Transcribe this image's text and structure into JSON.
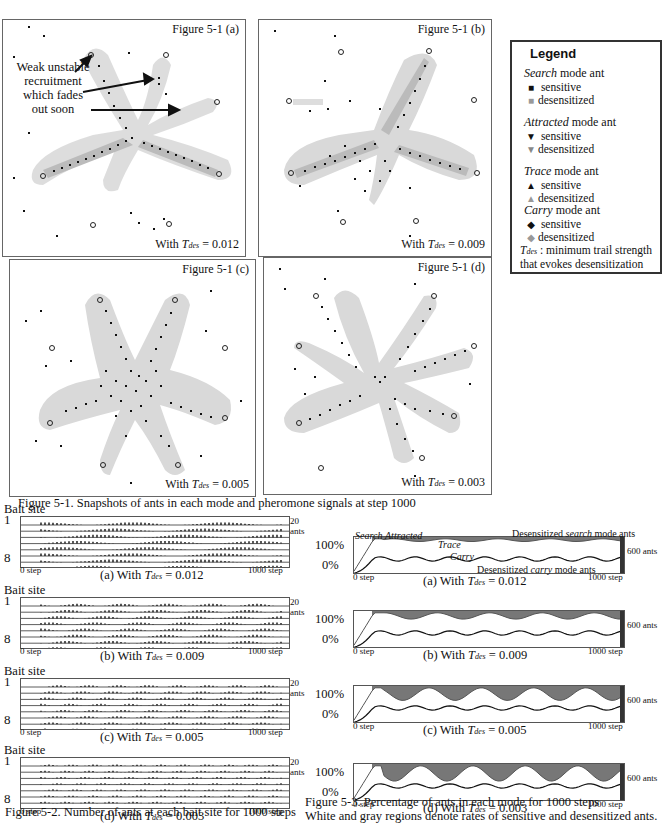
{
  "figure_5_1": {
    "panels": [
      {
        "id": "a",
        "title": "Figure 5-1 (a)",
        "caption_prefix": "With ",
        "tdes_label": "T",
        "tdes_sub": "des",
        "caption_value": " = 0.012"
      },
      {
        "id": "b",
        "title": "Figure 5-1 (b)",
        "caption_prefix": "With ",
        "tdes_label": "T",
        "tdes_sub": "des",
        "caption_value": " = 0.009"
      },
      {
        "id": "c",
        "title": "Figure 5-1 (c)",
        "caption_prefix": "With ",
        "tdes_label": "T",
        "tdes_sub": "des",
        "caption_value": " = 0.005"
      },
      {
        "id": "d",
        "title": "Figure 5-1 (d)",
        "caption_prefix": "With ",
        "tdes_label": "T",
        "tdes_sub": "des",
        "caption_value": " = 0.003"
      }
    ],
    "annotation": "Weak unstable recruitment which fades out soon",
    "annotation_lines": [
      "Weak unstable",
      "recruitment",
      "which fades",
      "out soon"
    ],
    "caption": "Figure 5-1. Snapshots of ants in each mode and pheromone signals at step 1000"
  },
  "legend": {
    "title": "Legend",
    "groups": [
      {
        "mode": "Search",
        "suffix": " mode ant",
        "sensitive": "sensitive",
        "desensitized": "desensitized",
        "symbol": "■"
      },
      {
        "mode": "Attracted",
        "suffix": " mode ant",
        "sensitive": "sensitive",
        "desensitized": "desensitized",
        "symbol": "▼"
      },
      {
        "mode": "Trace",
        "suffix": " mode ant",
        "sensitive": "sensitive",
        "desensitized": "desensitized",
        "symbol": "▲"
      },
      {
        "mode": "Carry",
        "suffix": " mode ant",
        "sensitive": "sensitive",
        "desensitized": "desensitized",
        "symbol": "◆"
      }
    ],
    "note_symbol": "T",
    "note_sub": "des",
    "note_text": " : minimum trail strength that evokes desensitization"
  },
  "figure_5_2": {
    "ylabel_top": "Bait site",
    "site_first": "1",
    "site_last": "8",
    "scale_label": "20 ants",
    "x_start": "0 step",
    "x_end": "1000 step",
    "subplots": [
      {
        "label": "(a) With ",
        "tdes": "T",
        "sub": "des",
        "value": " = 0.012"
      },
      {
        "label": "(b) With ",
        "tdes": "T",
        "sub": "des",
        "value": " = 0.009"
      },
      {
        "label": "(c) With ",
        "tdes": "T",
        "sub": "des",
        "value": " = 0.005"
      },
      {
        "label": "(d) With ",
        "tdes": "T",
        "sub": "des",
        "value": " = 0.003"
      }
    ],
    "caption": "Figure 5-2. Number of ants at each bait site for 1000 steps"
  },
  "figure_5_3": {
    "y_top": "100%",
    "y_bottom": "0%",
    "scale_label": "600 ants",
    "x_start": "0 step",
    "x_end": "1000 step",
    "annotations": {
      "search": "Search",
      "attracted": "Attracted",
      "trace": "Trace",
      "carry": "Carry",
      "desens_search_prefix": "Desensitized ",
      "desens_search_mode": "search",
      "desens_search_suffix": " mode ants",
      "desens_carry_prefix": "Desensitized ",
      "desens_carry_mode": "carry",
      "desens_carry_suffix": " mode ants"
    },
    "subplots": [
      {
        "label": "(a) With ",
        "tdes": "T",
        "sub": "des",
        "value": " = 0.012"
      },
      {
        "label": "(b) With ",
        "tdes": "T",
        "sub": "des",
        "value": " = 0.009"
      },
      {
        "label": "(c) With ",
        "tdes": "T",
        "sub": "des",
        "value": " = 0.005"
      },
      {
        "label": "(d) With ",
        "tdes": "T",
        "sub": "des",
        "value": " = 0.003"
      }
    ],
    "caption_line1": "Figure 5-3. Percentage of ants in each mode  for 1000 steps",
    "caption_line2": "White and gray regions denote rates of sensitive and desensitized ants."
  },
  "chart_data": [
    {
      "type": "scatter",
      "title": "Figure 5-1 (a)",
      "note": "Ant snapshot at step 1000, T_des = 0.012; 3 strong trails + weak unstable recruitment"
    },
    {
      "type": "scatter",
      "title": "Figure 5-1 (b)",
      "note": "Ant snapshot at step 1000, T_des = 0.009; 3 trails"
    },
    {
      "type": "scatter",
      "title": "Figure 5-1 (c)",
      "note": "Ant snapshot at step 1000, T_des = 0.005; 4-5 trails, dispersed ants"
    },
    {
      "type": "scatter",
      "title": "Figure 5-1 (d)",
      "note": "Ant snapshot at step 1000, T_des = 0.003; 6 trails"
    },
    {
      "type": "line",
      "title": "Figure 5-2",
      "xlabel": "step",
      "x_range": [
        0,
        1000
      ],
      "ylabel": "Bait site",
      "series_count": 8,
      "scale": "20 ants",
      "subplots": [
        "T_des = 0.012",
        "T_des = 0.009",
        "T_des = 0.005",
        "T_des = 0.003"
      ]
    },
    {
      "type": "area",
      "title": "Figure 5-3",
      "xlabel": "step",
      "x_range": [
        0,
        1000
      ],
      "ylabel": "Percentage",
      "ylim": [
        0,
        100
      ],
      "scale": "600 ants",
      "series": [
        "Search",
        "Attracted",
        "Trace",
        "Carry"
      ],
      "subplots": [
        "T_des = 0.012",
        "T_des = 0.009",
        "T_des = 0.005",
        "T_des = 0.003"
      ]
    }
  ]
}
